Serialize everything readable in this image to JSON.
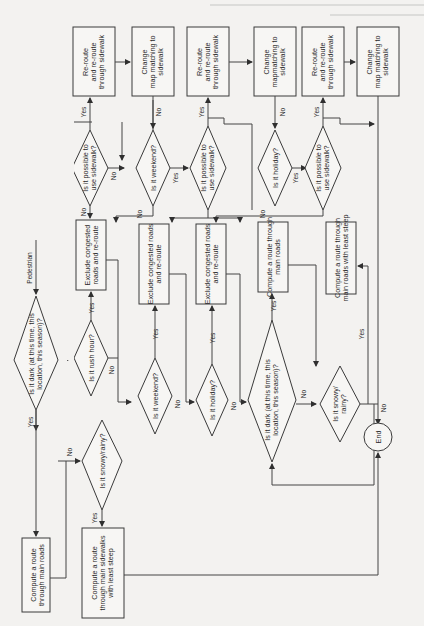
{
  "page": {
    "orientation": "rotated-90-clockwise",
    "caption_partial": "Fig. 2.1 ..."
  },
  "flowchart": {
    "start": {
      "label": "Modes of travel"
    },
    "branches": {
      "pedestrian": "Pedestrian",
      "driver": "Driver",
      "bike": "Bike Rider"
    },
    "nodes": {
      "ped_dark": "Is it dark (at this time, this location, this season)?",
      "ped_main": "Compute a route through main roads",
      "ped_snow": "Is it snowy/rainy?",
      "ped_sidewalk": "Compute a route through main sidewalks with least steep",
      "drv_rush": "Is it rush hour?",
      "drv_exclude1": "Exclude congested roads and re-route",
      "drv_weekend": "Is it weekend?",
      "drv_exclude2": "Exclude congested roads and re-route",
      "drv_holiday": "Is it holiday?",
      "drv_exclude3": "Exclude congested roads and re-route",
      "drv_dark": "Is it dark (at this time, this location, this season)?",
      "drv_main": "Compute a route through main roads",
      "drv_snow": "Is it snowy/ rainy?",
      "drv_least": "Compute a route through main roads with least steep",
      "bike_rush": "Is it rush hour?",
      "bike_side1": "Is it possible to use sidewalk?",
      "bike_reroute1": "Re-route and re-route through sidewalk",
      "bike_change1": "Change map matching to sidewalk",
      "bike_weekend": "Is it weekend?",
      "bike_side2": "Is it possible to use sidewalk?",
      "bike_reroute2": "Re-route and re-route through sidewalk",
      "bike_change2": "Change mapmatching to sidewalk",
      "bike_holiday": "Is it holiday?",
      "bike_side3": "Is it possible to use sidewalk?",
      "bike_reroute3": "Re-route and re-route through sidewalk",
      "bike_change3": "Change map matching to sidewalk",
      "end": "End"
    },
    "edge_labels": {
      "yes": "Yes",
      "no": "No"
    }
  }
}
